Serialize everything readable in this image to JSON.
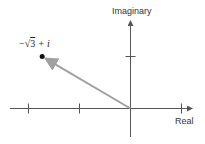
{
  "diagram": {
    "x_axis_label": "Real",
    "y_axis_label": "Imaginary",
    "point": {
      "label_prefix": "−",
      "label_radical": "√",
      "label_radicand": "3",
      "label_suffix": " + i",
      "re": -1.732,
      "im": 1
    },
    "real_ticks": [
      -2,
      -1,
      1
    ],
    "imag_ticks": [
      1
    ],
    "colors": {
      "axis": "#555555",
      "vector": "#a0a0a0",
      "point": "#111111"
    }
  }
}
